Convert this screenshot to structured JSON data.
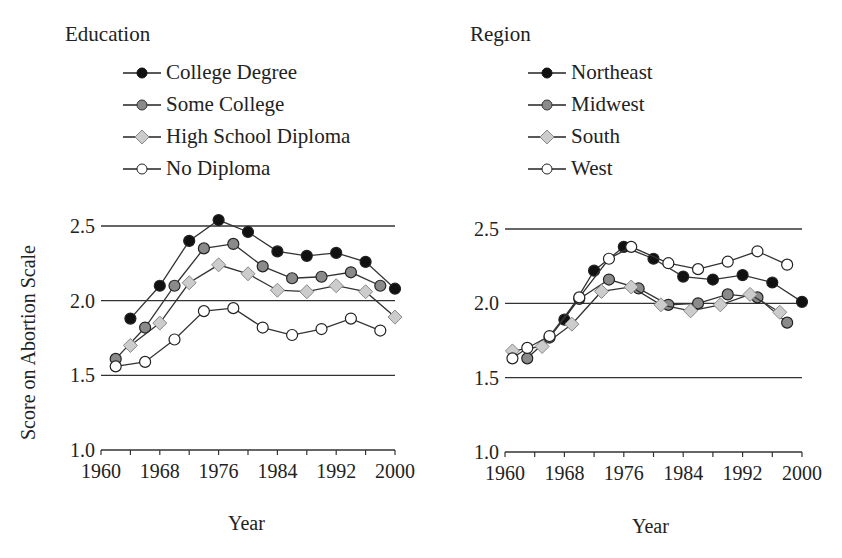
{
  "y_axis_label": "Score on Abortion Scale",
  "chart_data": [
    {
      "type": "line",
      "title": "Education",
      "xlabel": "Year",
      "ylabel": "Score on Abortion Scale",
      "xlim": [
        1960,
        2000
      ],
      "ylim": [
        1.0,
        2.5
      ],
      "x_ticks": [
        "1960",
        "1968",
        "1976",
        "1984",
        "1992",
        "2000"
      ],
      "y_ticks": [
        "1.0",
        "1.5",
        "2.0",
        "2.5"
      ],
      "gridlines_y": [
        1.5,
        2.0,
        2.5
      ],
      "legend_position": "top",
      "series": [
        {
          "name": "College Degree",
          "marker": "filled-black-circle",
          "color": "#111111",
          "x": [
            1964,
            1968,
            1972,
            1976,
            1980,
            1984,
            1988,
            1992,
            1996,
            2000
          ],
          "values": [
            1.88,
            2.1,
            2.4,
            2.54,
            2.46,
            2.33,
            2.3,
            2.32,
            2.26,
            2.08
          ]
        },
        {
          "name": "Some College",
          "marker": "gray-circle",
          "color": "#8a8a8a",
          "x": [
            1962,
            1966,
            1970,
            1974,
            1978,
            1982,
            1986,
            1990,
            1994,
            1998
          ],
          "values": [
            1.61,
            1.82,
            2.1,
            2.35,
            2.38,
            2.23,
            2.15,
            2.16,
            2.19,
            2.1
          ]
        },
        {
          "name": "High School Diploma",
          "marker": "light-gray-diamond",
          "color": "#cccccc",
          "x": [
            1964,
            1968,
            1972,
            1976,
            1980,
            1984,
            1988,
            1992,
            1996,
            2000
          ],
          "values": [
            1.7,
            1.85,
            2.12,
            2.24,
            2.18,
            2.07,
            2.06,
            2.1,
            2.06,
            1.89
          ]
        },
        {
          "name": "No Diploma",
          "marker": "open-circle",
          "color": "#ffffff",
          "x": [
            1962,
            1966,
            1970,
            1974,
            1978,
            1982,
            1986,
            1990,
            1994,
            1998
          ],
          "values": [
            1.56,
            1.59,
            1.74,
            1.93,
            1.95,
            1.82,
            1.77,
            1.81,
            1.88,
            1.8
          ]
        }
      ]
    },
    {
      "type": "line",
      "title": "Region",
      "xlabel": "Year",
      "ylabel": "Score on Abortion Scale",
      "xlim": [
        1960,
        2000
      ],
      "ylim": [
        1.0,
        2.5
      ],
      "x_ticks": [
        "1960",
        "1968",
        "1976",
        "1984",
        "1992",
        "2000"
      ],
      "y_ticks": [
        "1.0",
        "1.5",
        "2.0",
        "2.5"
      ],
      "gridlines_y": [
        1.5,
        2.0,
        2.5
      ],
      "legend_position": "top",
      "series": [
        {
          "name": "Northeast",
          "marker": "filled-black-circle",
          "color": "#111111",
          "x": [
            1968,
            1972,
            1976,
            1980,
            1984,
            1988,
            1992,
            1996,
            2000
          ],
          "values": [
            1.89,
            2.22,
            2.38,
            2.3,
            2.18,
            2.16,
            2.19,
            2.14,
            2.01
          ]
        },
        {
          "name": "Midwest",
          "marker": "gray-circle",
          "color": "#8a8a8a",
          "x": [
            1963,
            1966,
            1970,
            1974,
            1978,
            1982,
            1986,
            1990,
            1994,
            1998
          ],
          "values": [
            1.63,
            1.77,
            2.03,
            2.16,
            2.1,
            1.99,
            2.0,
            2.06,
            2.04,
            1.87
          ]
        },
        {
          "name": "South",
          "marker": "light-gray-diamond",
          "color": "#cccccc",
          "x": [
            1961,
            1965,
            1969,
            1973,
            1977,
            1981,
            1985,
            1989,
            1993,
            1997
          ],
          "values": [
            1.68,
            1.71,
            1.86,
            2.08,
            2.11,
            1.99,
            1.95,
            1.99,
            2.06,
            1.94
          ]
        },
        {
          "name": "West",
          "marker": "open-circle",
          "color": "#ffffff",
          "x": [
            1961,
            1963,
            1966,
            1970,
            1974,
            1977,
            1982,
            1986,
            1990,
            1994,
            1998
          ],
          "values": [
            1.63,
            1.7,
            1.78,
            2.04,
            2.3,
            2.38,
            2.27,
            2.23,
            2.28,
            2.35,
            2.26
          ]
        }
      ]
    }
  ],
  "panels": [
    {
      "legend_title": "Education",
      "legend": [
        "College Degree",
        "Some College",
        "High School Diploma",
        "No Diploma"
      ],
      "xlabel": "Year"
    },
    {
      "legend_title": "Region",
      "legend": [
        "Northeast",
        "Midwest",
        "South",
        "West"
      ],
      "xlabel": "Year"
    }
  ]
}
